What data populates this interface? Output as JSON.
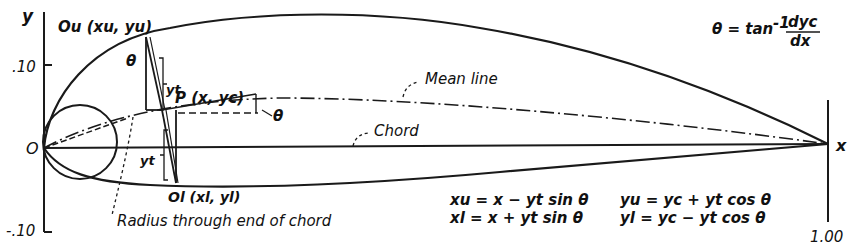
{
  "diagram": {
    "axes": {
      "y_label": "y",
      "x_label": "x",
      "origin_label": "O",
      "y_ticks": [
        ".10",
        "-.10"
      ],
      "x_end_label": "1.00"
    },
    "labels": {
      "upper_point": "Ou (xu, yu)",
      "lower_point": "Ol (xl, yl)",
      "mean_point": "P (x, yc)",
      "thickness_upper": "yt",
      "thickness_lower": "yt",
      "theta_upper": "θ",
      "theta_mean": "θ",
      "mean_line": "Mean line",
      "chord": "Chord",
      "radius_note": "Radius through end of chord"
    },
    "equations": {
      "theta_def": "θ = tan⁻¹ dyc/dx",
      "theta_lhs": "θ = tan",
      "theta_exp": "-1",
      "theta_num": "dyc",
      "theta_den": "dx",
      "xu": "xu = x − yt sin θ",
      "yu": "yu = yc + yt cos θ",
      "xl": "xl = x + yt sin θ",
      "yl": "yl = yc − yt cos θ"
    }
  }
}
